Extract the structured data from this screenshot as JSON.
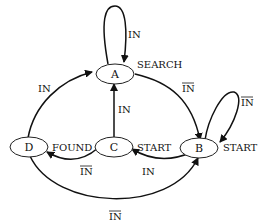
{
  "diagram": {
    "type": "state-diagram",
    "states": [
      {
        "id": "A",
        "label": "A",
        "output": "SEARCH"
      },
      {
        "id": "B",
        "label": "B",
        "output": "START"
      },
      {
        "id": "C",
        "label": "C",
        "output": "START"
      },
      {
        "id": "D",
        "label": "D",
        "output": "FOUND"
      }
    ],
    "transitions": [
      {
        "from": "A",
        "to": "A",
        "label": "IN",
        "negated": false
      },
      {
        "from": "A",
        "to": "B",
        "label": "IN",
        "negated": true
      },
      {
        "from": "B",
        "to": "B",
        "label": "IN",
        "negated": true
      },
      {
        "from": "B",
        "to": "C",
        "label": "IN",
        "negated": false
      },
      {
        "from": "C",
        "to": "A",
        "label": "IN",
        "negated": false
      },
      {
        "from": "C",
        "to": "D",
        "label": "IN",
        "negated": true
      },
      {
        "from": "D",
        "to": "A",
        "label": "IN",
        "negated": false
      },
      {
        "from": "D",
        "to": "B",
        "label": "IN",
        "negated": true
      }
    ]
  }
}
